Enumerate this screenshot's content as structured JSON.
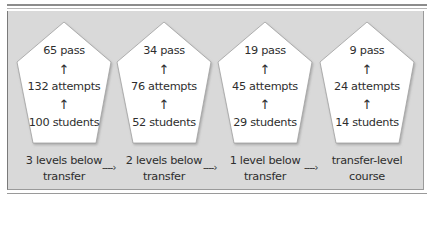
{
  "diagram": {
    "stages": [
      {
        "label_line1": "3 levels below",
        "label_line2": "transfer",
        "pass": "65 pass",
        "attempts": "132 attempts",
        "students": "100 students"
      },
      {
        "label_line1": "2 levels below",
        "label_line2": "transfer",
        "pass": "34 pass",
        "attempts": "76 attempts",
        "students": "52 students"
      },
      {
        "label_line1": "1 level below",
        "label_line2": "transfer",
        "pass": "19 pass",
        "attempts": "45 attempts",
        "students": "29 students"
      },
      {
        "label_line1": "transfer-level",
        "label_line2": "course",
        "pass": "9 pass",
        "attempts": "24 attempts",
        "students": "14 students"
      }
    ],
    "up_arrow": "↑",
    "flow_arrow": "----›",
    "colors": {
      "panel": "#d9d9d9",
      "pentagon_fill": "#ffffff",
      "pentagon_stroke": "#9a9a9a",
      "text": "#2e2e2e"
    }
  }
}
